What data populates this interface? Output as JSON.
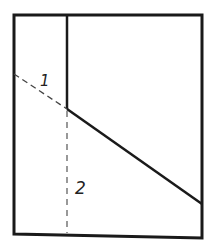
{
  "diagram": {
    "type": "geometric-cross-section",
    "colors": {
      "stroke": "#1a1a1a",
      "dashed": "#444444",
      "background": "#ffffff"
    },
    "outer_frame": {
      "points": [
        [
          14,
          15
        ],
        [
          202,
          15
        ],
        [
          202,
          238
        ],
        [
          14,
          234
        ]
      ]
    },
    "vertical_divider": {
      "x1": 67,
      "y1": 15,
      "x2": 67,
      "y2": 109,
      "style": "solid"
    },
    "diagonal_solid": {
      "x1": 67,
      "y1": 109,
      "x2": 202,
      "y2": 204,
      "style": "solid"
    },
    "diagonal_dashed": {
      "x1": 14,
      "y1": 74,
      "x2": 67,
      "y2": 109,
      "style": "dashed"
    },
    "vertical_dashed": {
      "x1": 67,
      "y1": 111,
      "x2": 67,
      "y2": 233,
      "style": "dashed"
    },
    "labels": [
      {
        "id": "label-1",
        "text": "1",
        "x": 42,
        "y": 86
      },
      {
        "id": "label-2",
        "text": "2",
        "x": 76,
        "y": 193
      }
    ]
  }
}
